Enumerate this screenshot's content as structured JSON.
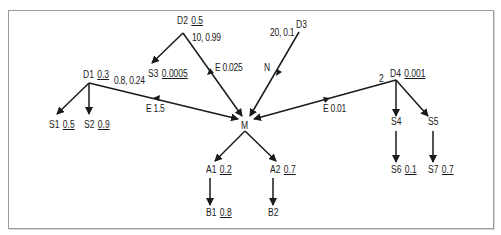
{
  "diagram": {
    "nodes": [
      {
        "id": "D2",
        "label": "D2",
        "prob": "0.5"
      },
      {
        "id": "D3",
        "label": "D3",
        "prob": ""
      },
      {
        "id": "D1",
        "label": "D1",
        "prob": "0.3"
      },
      {
        "id": "S3",
        "label": "S3",
        "prob": "0.0005"
      },
      {
        "id": "D4",
        "label": "D4",
        "prob": "0.001"
      },
      {
        "id": "S1",
        "label": "S1",
        "prob": "0.5"
      },
      {
        "id": "S2",
        "label": "S2",
        "prob": "0.9"
      },
      {
        "id": "M",
        "label": "M",
        "prob": ""
      },
      {
        "id": "S4",
        "label": "S4",
        "prob": ""
      },
      {
        "id": "S5",
        "label": "S5",
        "prob": ""
      },
      {
        "id": "A1",
        "label": "A1",
        "prob": "0.2"
      },
      {
        "id": "A2",
        "label": "A2",
        "prob": "0.7"
      },
      {
        "id": "S6",
        "label": "S6",
        "prob": "0.1"
      },
      {
        "id": "S7",
        "label": "S7",
        "prob": "0.7"
      },
      {
        "id": "B1",
        "label": "B1",
        "prob": "0.8"
      },
      {
        "id": "B2",
        "label": "B2",
        "prob": ""
      }
    ],
    "edge_labels": {
      "d2_params": "10, 0.99",
      "d3_params": "20, 0.1",
      "d1_params": "0.8, 0.24",
      "d4_params": "2",
      "e_d2": "E 0.025",
      "e_d3": "N",
      "e_d1": "E 1.5",
      "e_d4": "E 0.01"
    }
  }
}
